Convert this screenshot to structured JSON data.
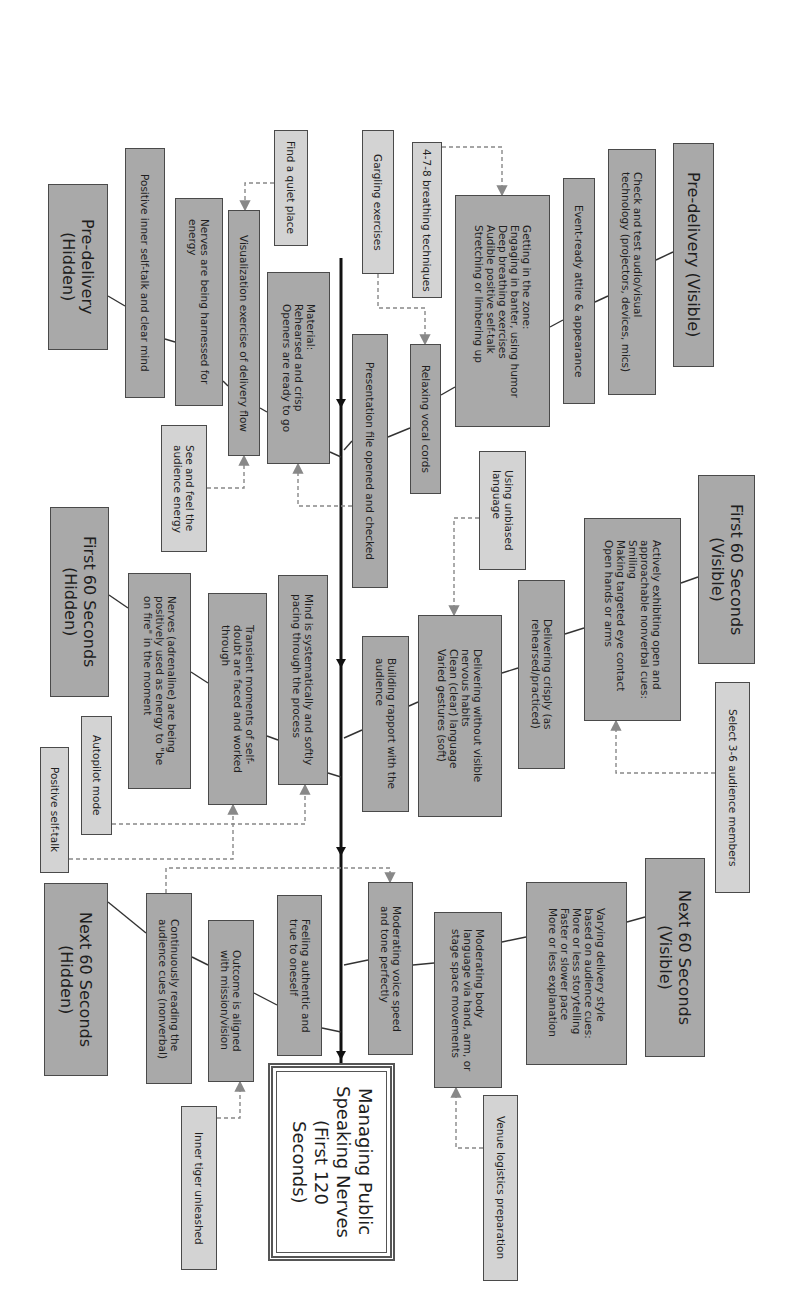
{
  "diagram": {
    "title": "Managing Public Speaking Nerves (First 120 Seconds)",
    "orientation": "rotated 90° clockwise (text reads top-to-bottom)",
    "colors": {
      "category_fill": "#a9a9a9",
      "tip_fill": "#d3d3d3",
      "border": "#4a4a4a",
      "spine": "#111111",
      "dashed": "#888888"
    },
    "root": {
      "label": "Managing Public\nSpeaking Nerves\n(First 120\nSeconds)",
      "rect": [
        268,
        1063,
        127,
        198
      ]
    },
    "spine": {
      "x": 341,
      "y1": 258,
      "y2": 1063,
      "arrow_ys": [
        408,
        668,
        856,
        1060
      ]
    },
    "nodes": [
      {
        "id": "pre-visible",
        "type": "header",
        "label": "Pre-delivery (Visible)",
        "rect": [
          673,
          143,
          41,
          224
        ]
      },
      {
        "id": "check-av",
        "type": "dark",
        "label": "Check and test audio/visual\ntechnology (projectors, devices, mics)",
        "rect": [
          608,
          149,
          48,
          246
        ]
      },
      {
        "id": "attire",
        "type": "dark",
        "label": "Event-ready attire & appearance",
        "rect": [
          563,
          178,
          32,
          226
        ]
      },
      {
        "id": "zone",
        "type": "dark",
        "label": "Getting in the zone:\nEngaging in banter, using humor\nDeep breathing exercises\nAudible positive self-talk\nStretching or limbering up",
        "rect": [
          455,
          195,
          95,
          232
        ]
      },
      {
        "id": "breathing-478",
        "type": "light",
        "label": "4-7-8 breathing techniques",
        "rect": [
          412,
          142,
          30,
          156
        ]
      },
      {
        "id": "gargling",
        "type": "light",
        "label": "Gargling exercises",
        "rect": [
          362,
          130,
          32,
          144
        ]
      },
      {
        "id": "vocal-cords",
        "type": "dark",
        "label": "Relaxing vocal cords",
        "rect": [
          410,
          344,
          31,
          150
        ]
      },
      {
        "id": "presentation-file",
        "type": "dark",
        "label": "Presentation file opened and checked",
        "rect": [
          352,
          334,
          36,
          254
        ]
      },
      {
        "id": "material",
        "type": "dark",
        "label": "Material:\nRehearsed and crisp\nOpeners are ready to go",
        "rect": [
          267,
          272,
          63,
          192
        ]
      },
      {
        "id": "find-quiet",
        "type": "light",
        "label": "Find a quiet place",
        "rect": [
          274,
          130,
          34,
          116
        ]
      },
      {
        "id": "visualization",
        "type": "dark",
        "label": "Visualization exercise of delivery flow",
        "rect": [
          228,
          210,
          32,
          246
        ]
      },
      {
        "id": "see-feel",
        "type": "light",
        "label": "See and feel the\naudience energy",
        "rect": [
          161,
          425,
          46,
          127
        ]
      },
      {
        "id": "nerves-harnessed",
        "type": "dark",
        "label": "Nerves are being harnessed for\nenergy",
        "rect": [
          175,
          198,
          48,
          208
        ]
      },
      {
        "id": "positive-inner",
        "type": "dark",
        "label": "Positive inner self-talk and clear mind",
        "rect": [
          125,
          148,
          40,
          250
        ]
      },
      {
        "id": "pre-hidden",
        "type": "header",
        "label": "Pre-delivery\n(Hidden)",
        "rect": [
          48,
          184,
          60,
          166
        ]
      },
      {
        "id": "first60-visible",
        "type": "header",
        "label": "First 60 Seconds\n(Visible)",
        "rect": [
          698,
          475,
          57,
          189
        ]
      },
      {
        "id": "nonverbal",
        "type": "dark",
        "label": "Actively exhibiting open and\napproachable nonverbal cues:\nSmiling\nMaking targeted eye contact\nOpen hands or arms",
        "rect": [
          584,
          518,
          97,
          203
        ]
      },
      {
        "id": "crisply",
        "type": "dark",
        "label": "Delivering crisply (as\nrehearsed/practiced)",
        "rect": [
          518,
          580,
          47,
          189
        ]
      },
      {
        "id": "unbiased",
        "type": "light",
        "label": "Using unbiased\nlanguage",
        "rect": [
          479,
          451,
          47,
          119
        ]
      },
      {
        "id": "nervous-habits",
        "type": "dark",
        "label": "Delivering without visible\nnervous habits\nClean (clear) language\nVaried gestures (soft)",
        "rect": [
          418,
          615,
          84,
          202
        ]
      },
      {
        "id": "rapport",
        "type": "dark",
        "label": "Building rapport with the\naudience",
        "rect": [
          362,
          636,
          47,
          176
        ]
      },
      {
        "id": "select-audience",
        "type": "light",
        "label": "Select 3-6 audience members",
        "rect": [
          715,
          682,
          35,
          211
        ]
      },
      {
        "id": "mind-pacing",
        "type": "dark",
        "label": "Mind is systematically and softly\npacing through the process",
        "rect": [
          278,
          575,
          50,
          210
        ]
      },
      {
        "id": "transient",
        "type": "dark",
        "label": "Transient moments of self-\ndoubt are faced and worked\nthrough",
        "rect": [
          208,
          593,
          59,
          212
        ]
      },
      {
        "id": "nerves-adrenaline",
        "type": "dark",
        "label": "Nerves (adrenaline) are being\npositively used as energy to \"be\non fire\" in the moment",
        "rect": [
          128,
          573,
          63,
          216
        ]
      },
      {
        "id": "first60-hidden",
        "type": "header",
        "label": "First 60 Seconds\n(Hidden)",
        "rect": [
          50,
          507,
          59,
          190
        ]
      },
      {
        "id": "autopilot",
        "type": "light",
        "label": "Autopilot mode",
        "rect": [
          81,
          716,
          31,
          119
        ]
      },
      {
        "id": "positive-self-talk",
        "type": "light",
        "label": "Positive self-talk",
        "rect": [
          40,
          747,
          29,
          126
        ]
      },
      {
        "id": "next60-visible",
        "type": "header",
        "label": "Next 60 Seconds\n(Visible)",
        "rect": [
          645,
          858,
          60,
          199
        ]
      },
      {
        "id": "varying-style",
        "type": "dark",
        "label": "Varying delivery style\nbased on audience cues:\nMore or less storytelling\nFaster or slower pace\nMore or less explanation",
        "rect": [
          526,
          882,
          101,
          183
        ]
      },
      {
        "id": "body-language",
        "type": "dark",
        "label": "Moderating body\nlanguage via hand, arm, or\nstage space movements",
        "rect": [
          434,
          912,
          68,
          176
        ]
      },
      {
        "id": "voice-speed",
        "type": "dark",
        "label": "Moderating voice speed\nand tone perfectly",
        "rect": [
          368,
          882,
          45,
          173
        ]
      },
      {
        "id": "venue-logistics",
        "type": "light",
        "label": "Venue logistics preparation",
        "rect": [
          483,
          1095,
          35,
          186
        ]
      },
      {
        "id": "authentic",
        "type": "dark",
        "label": "Feeling authentic and\ntrue to oneself",
        "rect": [
          277,
          895,
          45,
          161
        ]
      },
      {
        "id": "outcome",
        "type": "dark",
        "label": "Outcome is aligned\nwith mission/vision",
        "rect": [
          208,
          920,
          46,
          162
        ]
      },
      {
        "id": "continuous",
        "type": "dark",
        "label": "Continuously reading the\naudience cues (nonverbal)",
        "rect": [
          146,
          893,
          46,
          191
        ]
      },
      {
        "id": "next60-hidden",
        "type": "header",
        "label": "Next 60 Seconds\n(Hidden)",
        "rect": [
          44,
          883,
          64,
          193
        ]
      },
      {
        "id": "inner-tiger",
        "type": "light",
        "label": "Inner tiger unleashed",
        "rect": [
          181,
          1106,
          36,
          164
        ]
      }
    ],
    "solid_connectors": [
      [
        673,
        252,
        656,
        260
      ],
      [
        608,
        296,
        595,
        302
      ],
      [
        563,
        320,
        550,
        327
      ],
      [
        455,
        387,
        441,
        395
      ],
      [
        410,
        428,
        388,
        437
      ],
      [
        352,
        441,
        344,
        450
      ],
      [
        330,
        452,
        341,
        457
      ],
      [
        267,
        412,
        260,
        408
      ],
      [
        228,
        386,
        223,
        381
      ],
      [
        175,
        342,
        165,
        339
      ],
      [
        125,
        306,
        108,
        296
      ],
      [
        698,
        577,
        681,
        583
      ],
      [
        584,
        628,
        565,
        634
      ],
      [
        518,
        668,
        502,
        673
      ],
      [
        418,
        702,
        409,
        706
      ],
      [
        362,
        730,
        344,
        738
      ],
      [
        328,
        773,
        341,
        777
      ],
      [
        278,
        740,
        267,
        736
      ],
      [
        208,
        683,
        191,
        672
      ],
      [
        128,
        608,
        109,
        595
      ],
      [
        645,
        917,
        627,
        922
      ],
      [
        526,
        937,
        502,
        942
      ],
      [
        434,
        963,
        413,
        965
      ],
      [
        368,
        960,
        344,
        965
      ],
      [
        322,
        1028,
        341,
        1032
      ],
      [
        277,
        1005,
        254,
        993
      ],
      [
        208,
        965,
        192,
        957
      ],
      [
        146,
        933,
        108,
        902
      ]
    ],
    "dashed_connectors": [
      {
        "points": [
          [
            442,
            147
          ],
          [
            502,
            147
          ],
          [
            502,
            195
          ]
        ]
      },
      {
        "points": [
          [
            378,
            274
          ],
          [
            378,
            308
          ],
          [
            425,
            308
          ],
          [
            425,
            344
          ]
        ]
      },
      {
        "points": [
          [
            274,
            183
          ],
          [
            245,
            183
          ],
          [
            245,
            210
          ]
        ]
      },
      {
        "points": [
          [
            352,
            506
          ],
          [
            298,
            506
          ],
          [
            298,
            464
          ]
        ]
      },
      {
        "points": [
          [
            207,
            488
          ],
          [
            244,
            488
          ],
          [
            244,
            456
          ]
        ]
      },
      {
        "points": [
          [
            479,
            518
          ],
          [
            454,
            518
          ],
          [
            454,
            615
          ]
        ]
      },
      {
        "points": [
          [
            715,
            773
          ],
          [
            616,
            773
          ],
          [
            616,
            721
          ]
        ]
      },
      {
        "points": [
          [
            112,
            824
          ],
          [
            305,
            824
          ],
          [
            305,
            785
          ]
        ]
      },
      {
        "points": [
          [
            69,
            859
          ],
          [
            233,
            859
          ],
          [
            233,
            805
          ]
        ]
      },
      {
        "points": [
          [
            166,
            893
          ],
          [
            166,
            868
          ],
          [
            390,
            868
          ],
          [
            390,
            882
          ]
        ]
      },
      {
        "points": [
          [
            483,
            1148
          ],
          [
            456,
            1148
          ],
          [
            456,
            1088
          ]
        ]
      },
      {
        "points": [
          [
            217,
            1118
          ],
          [
            240,
            1118
          ],
          [
            240,
            1082
          ]
        ]
      }
    ]
  }
}
